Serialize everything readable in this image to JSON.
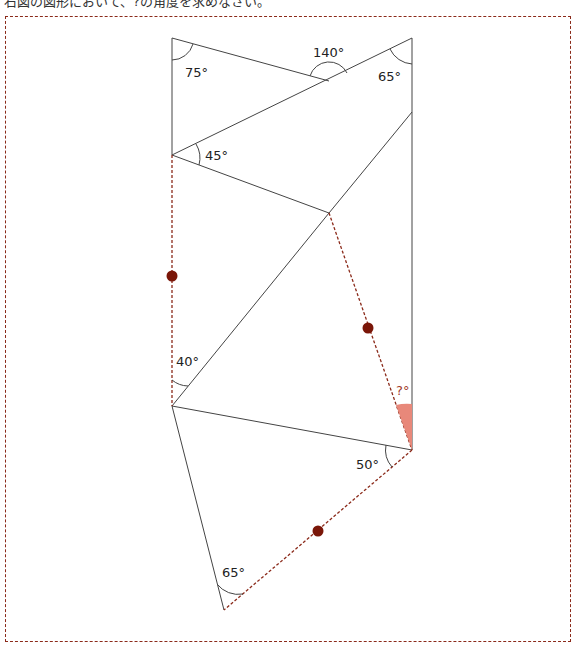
{
  "title": "右図の図形において、?の角度を求めなさい。",
  "angles": {
    "a1": "75°",
    "a2": "140°",
    "a3": "65°",
    "a4": "45°",
    "a5": "40°",
    "a6": "50°",
    "a7": "65°",
    "unknown": "?°"
  },
  "colors": {
    "line": "#444444",
    "dashed": "#8b2a1a",
    "dot": "#7a1608",
    "highlight": "#e8887a"
  }
}
